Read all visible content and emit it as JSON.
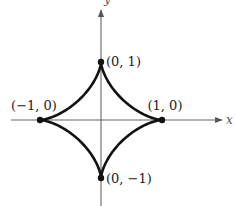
{
  "chart_data": {
    "type": "line",
    "title": "",
    "xlabel": "x",
    "ylabel": "y",
    "curve": "astroid x^(2/3) + y^(2/3) = 1",
    "parametric": {
      "x": "cos^3(t)",
      "y": "sin^3(t)",
      "t_range": [
        0,
        6.283185
      ]
    },
    "xlim": [
      -1.5,
      2.0
    ],
    "ylim": [
      -1.5,
      1.9
    ],
    "grid": false,
    "legend": null,
    "points": [
      {
        "x": 0,
        "y": 1,
        "label": "(0,  1)"
      },
      {
        "x": 1,
        "y": 0,
        "label": "(1,  0)"
      },
      {
        "x": -1,
        "y": 0,
        "label": "(−1,  0)"
      },
      {
        "x": 0,
        "y": -1,
        "label": "(0,  −1)"
      }
    ]
  },
  "colors": {
    "curve": "#111111",
    "axis": "#555555",
    "background": "#ffffff"
  }
}
